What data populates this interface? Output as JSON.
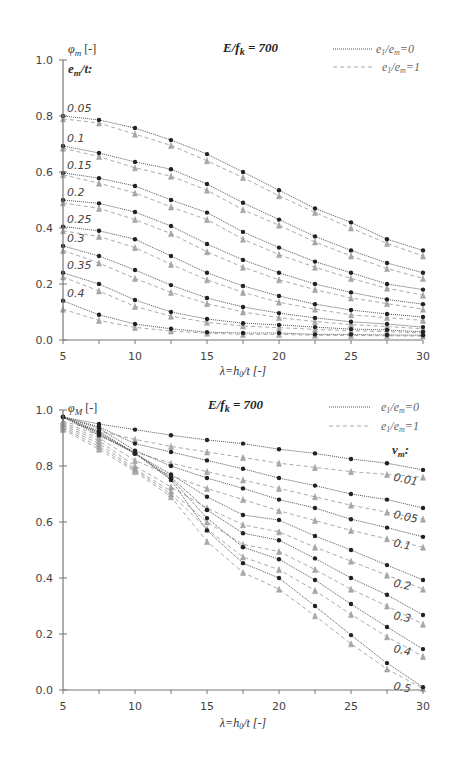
{
  "chart_data": [
    {
      "type": "line",
      "title": "E/f_k = 700",
      "ylabel": "φm [-]",
      "xlabel": "λ=h0/t [-]",
      "group_label": "em/t:",
      "xlim": [
        5,
        30
      ],
      "ylim": [
        0,
        1.0
      ],
      "x_ticks": [
        5,
        10,
        15,
        20,
        25,
        30
      ],
      "y_ticks": [
        "0.0",
        "0.2",
        "0.4",
        "0.6",
        "0.8",
        "1.0"
      ],
      "grid": false,
      "legend": [
        {
          "label": "e1/em=0",
          "style": "dotted",
          "color": "#555555"
        },
        {
          "label": "e1/em=1",
          "style": "dashed",
          "color": "#aaaaaa"
        }
      ],
      "legend_position": "top-right",
      "x": [
        5,
        7.5,
        10,
        12.5,
        15,
        17.5,
        20,
        22.5,
        25,
        27.5,
        30
      ],
      "series": [
        {
          "name": "0.05",
          "values_e0": [
            0.8,
            0.786,
            0.757,
            0.714,
            0.664,
            0.6,
            0.535,
            0.47,
            0.42,
            0.36,
            0.32
          ],
          "values_e1": [
            0.79,
            0.775,
            0.735,
            0.695,
            0.64,
            0.58,
            0.515,
            0.455,
            0.4,
            0.345,
            0.3
          ]
        },
        {
          "name": "0.1",
          "values_e0": [
            0.693,
            0.668,
            0.636,
            0.61,
            0.557,
            0.49,
            0.43,
            0.37,
            0.32,
            0.275,
            0.24
          ],
          "values_e1": [
            0.685,
            0.655,
            0.615,
            0.585,
            0.535,
            0.465,
            0.41,
            0.35,
            0.3,
            0.255,
            0.22
          ]
        },
        {
          "name": "0.15",
          "values_e0": [
            0.597,
            0.578,
            0.55,
            0.5,
            0.455,
            0.386,
            0.33,
            0.28,
            0.24,
            0.2,
            0.18
          ],
          "values_e1": [
            0.59,
            0.56,
            0.525,
            0.475,
            0.43,
            0.36,
            0.305,
            0.26,
            0.22,
            0.185,
            0.16
          ]
        },
        {
          "name": "0.2",
          "values_e0": [
            0.5,
            0.488,
            0.457,
            0.407,
            0.343,
            0.286,
            0.24,
            0.2,
            0.17,
            0.145,
            0.128
          ],
          "values_e1": [
            0.49,
            0.47,
            0.43,
            0.38,
            0.315,
            0.26,
            0.215,
            0.18,
            0.15,
            0.13,
            0.11
          ]
        },
        {
          "name": "0.25",
          "values_e0": [
            0.405,
            0.39,
            0.36,
            0.3,
            0.24,
            0.193,
            0.157,
            0.128,
            0.107,
            0.093,
            0.082
          ],
          "values_e1": [
            0.39,
            0.37,
            0.33,
            0.27,
            0.215,
            0.17,
            0.135,
            0.11,
            0.09,
            0.08,
            0.07
          ]
        },
        {
          "name": "0.3",
          "values_e0": [
            0.336,
            0.3,
            0.25,
            0.196,
            0.15,
            0.118,
            0.096,
            0.079,
            0.065,
            0.057,
            0.046
          ],
          "values_e1": [
            0.32,
            0.275,
            0.22,
            0.17,
            0.13,
            0.1,
            0.08,
            0.066,
            0.055,
            0.048,
            0.04
          ]
        },
        {
          "name": "0.35",
          "values_e0": [
            0.24,
            0.2,
            0.143,
            0.1,
            0.075,
            0.06,
            0.054,
            0.046,
            0.039,
            0.036,
            0.029
          ],
          "values_e1": [
            0.225,
            0.175,
            0.12,
            0.085,
            0.063,
            0.05,
            0.044,
            0.038,
            0.033,
            0.03,
            0.025
          ]
        },
        {
          "name": "0.4",
          "values_e0": [
            0.14,
            0.09,
            0.057,
            0.04,
            0.028,
            0.025,
            0.025,
            0.02,
            0.02,
            0.018,
            0.017
          ],
          "values_e1": [
            0.11,
            0.07,
            0.045,
            0.032,
            0.024,
            0.02,
            0.02,
            0.017,
            0.016,
            0.015,
            0.014
          ]
        }
      ]
    },
    {
      "type": "line",
      "title": "E/f_k = 700",
      "ylabel": "φM [-]",
      "xlabel": "λ=h0/t [-]",
      "group_label": "vm:",
      "xlim": [
        5,
        30
      ],
      "ylim": [
        0,
        1.0
      ],
      "x_ticks": [
        5,
        10,
        15,
        20,
        25,
        30
      ],
      "y_ticks": [
        "0.0",
        "0.2",
        "0.4",
        "0.6",
        "0.8",
        "1.0"
      ],
      "grid": false,
      "legend": [
        {
          "label": "e1/em=0",
          "style": "dotted",
          "color": "#555555"
        },
        {
          "label": "e1/em=1",
          "style": "dashed",
          "color": "#aaaaaa"
        }
      ],
      "legend_position": "top-right",
      "x": [
        5,
        7.5,
        10,
        12.5,
        15,
        17.5,
        20,
        22.5,
        25,
        27.5,
        30
      ],
      "series": [
        {
          "name": "0.01",
          "values_e0": [
            0.975,
            0.95,
            0.93,
            0.91,
            0.893,
            0.88,
            0.86,
            0.845,
            0.825,
            0.81,
            0.786
          ],
          "values_e1": [
            0.96,
            0.925,
            0.895,
            0.87,
            0.85,
            0.83,
            0.81,
            0.795,
            0.78,
            0.77,
            0.76
          ]
        },
        {
          "name": "0.05",
          "values_e0": [
            0.975,
            0.94,
            0.88,
            0.85,
            0.82,
            0.79,
            0.757,
            0.73,
            0.7,
            0.68,
            0.65
          ],
          "values_e1": [
            0.955,
            0.91,
            0.85,
            0.81,
            0.78,
            0.75,
            0.72,
            0.69,
            0.66,
            0.635,
            0.61
          ]
        },
        {
          "name": "0.1",
          "values_e0": [
            0.975,
            0.935,
            0.855,
            0.8,
            0.757,
            0.72,
            0.68,
            0.65,
            0.61,
            0.58,
            0.547
          ],
          "values_e1": [
            0.95,
            0.9,
            0.82,
            0.765,
            0.72,
            0.68,
            0.64,
            0.605,
            0.57,
            0.54,
            0.51
          ]
        },
        {
          "name": "0.2",
          "values_e0": [
            0.975,
            0.925,
            0.845,
            0.77,
            0.69,
            0.625,
            0.607,
            0.55,
            0.5,
            0.446,
            0.393
          ],
          "values_e1": [
            0.945,
            0.89,
            0.8,
            0.725,
            0.65,
            0.59,
            0.565,
            0.51,
            0.46,
            0.41,
            0.36
          ]
        },
        {
          "name": "0.3",
          "values_e0": [
            0.975,
            0.92,
            0.845,
            0.76,
            0.643,
            0.56,
            0.535,
            0.47,
            0.4,
            0.34,
            0.268
          ],
          "values_e1": [
            0.94,
            0.88,
            0.79,
            0.71,
            0.6,
            0.52,
            0.495,
            0.43,
            0.36,
            0.3,
            0.235
          ]
        },
        {
          "name": "0.4",
          "values_e0": [
            0.975,
            0.915,
            0.845,
            0.755,
            0.614,
            0.51,
            0.467,
            0.393,
            0.307,
            0.225,
            0.146
          ],
          "values_e1": [
            0.935,
            0.87,
            0.785,
            0.7,
            0.575,
            0.475,
            0.43,
            0.355,
            0.27,
            0.19,
            0.12
          ]
        },
        {
          "name": "0.5",
          "values_e0": [
            0.975,
            0.91,
            0.845,
            0.75,
            0.57,
            0.453,
            0.4,
            0.3,
            0.196,
            0.096,
            0.01
          ],
          "values_e1": [
            0.93,
            0.86,
            0.78,
            0.69,
            0.53,
            0.42,
            0.36,
            0.265,
            0.165,
            0.075,
            0.005
          ]
        }
      ]
    }
  ],
  "labels": {
    "chart1_ylabel": "φ",
    "chart1_ylabel_sub": "m",
    "chart1_ylabel_unit": " [-]",
    "chart1_title": "E/f",
    "chart1_title_sub": "k",
    "chart1_title_val": " = 700",
    "chart1_group": "e",
    "chart1_group_sub": "m",
    "chart1_group_rest": "/t:",
    "chart2_ylabel": "φ",
    "chart2_ylabel_sub": "M",
    "chart2_ylabel_unit": " [-]",
    "chart2_title": "E/f",
    "chart2_title_sub": "k",
    "chart2_title_val": " = 700",
    "chart2_group": "v",
    "chart2_group_sub": "m",
    "chart2_group_rest": ":",
    "xlabel_main": "λ=h",
    "xlabel_sub": "0",
    "xlabel_rest": "/t [-]",
    "legend0_a": "e",
    "legend0_a_sub": "1",
    "legend0_b": "/e",
    "legend0_b_sub": "m",
    "legend0_c": "=0",
    "legend1_c": "=1"
  }
}
